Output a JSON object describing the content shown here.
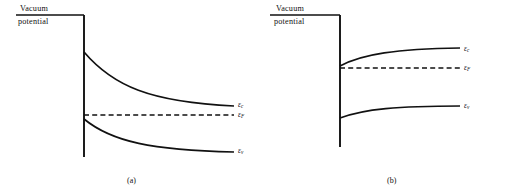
{
  "figure": {
    "width": 515,
    "height": 193,
    "background": "#ffffff",
    "line_color": "#111111"
  },
  "panels": [
    {
      "id": "a",
      "caption": "(a)",
      "caption_x": 127,
      "caption_y": 176,
      "vacuum": {
        "label_top": "Vacuum",
        "label_bottom": "potential",
        "label_top_x": 20,
        "label_top_y": 4,
        "label_bottom_x": 18,
        "label_bottom_y": 17,
        "line_x1": 16,
        "line_x2": 84,
        "line_y": 15
      },
      "wall": {
        "x": 84,
        "y_top": 15,
        "y_bottom": 157
      },
      "bands": [
        {
          "name": "conduction-band",
          "label": "ε",
          "label_sub": "c",
          "label_x": 238,
          "label_y": 100,
          "style": "solid",
          "start_x": 84,
          "start_y": 52,
          "end_x": 234,
          "end_y": 106,
          "bend": "downward",
          "path": "M 84 52 C 113 86, 150 102, 234 106"
        },
        {
          "name": "fermi-level",
          "label": "ε",
          "label_sub": "F",
          "label_x": 238,
          "label_y": 110,
          "style": "dashed",
          "start_x": 84,
          "start_y": 115,
          "end_x": 234,
          "end_y": 115,
          "bend": "flat",
          "path": "M 84 115 L 234 115"
        },
        {
          "name": "valence-band",
          "label": "ε",
          "label_sub": "v",
          "label_x": 238,
          "label_y": 146,
          "style": "solid",
          "start_x": 84,
          "start_y": 119,
          "end_x": 234,
          "end_y": 152,
          "bend": "downward",
          "path": "M 84 119 C 112 142, 152 150, 234 152"
        }
      ]
    },
    {
      "id": "b",
      "caption": "(b)",
      "caption_x": 129,
      "caption_y": 176,
      "vacuum": {
        "label_top": "Vacuum",
        "label_bottom": "potential",
        "label_top_x": 18,
        "label_top_y": 4,
        "label_bottom_x": 16,
        "label_bottom_y": 17,
        "line_x1": 12,
        "line_x2": 82,
        "line_y": 15
      },
      "wall": {
        "x": 82,
        "y_top": 15,
        "y_bottom": 147
      },
      "bands": [
        {
          "name": "conduction-band",
          "label": "ε",
          "label_sub": "c",
          "label_x": 206,
          "label_y": 44,
          "style": "solid",
          "start_x": 82,
          "start_y": 66,
          "end_x": 202,
          "end_y": 48,
          "bend": "upward",
          "path": "M 82 66 C 104 54, 138 49, 202 48"
        },
        {
          "name": "fermi-level",
          "label": "ε",
          "label_sub": "F",
          "label_x": 206,
          "label_y": 63,
          "style": "dashed",
          "start_x": 82,
          "start_y": 68,
          "end_x": 202,
          "end_y": 68,
          "bend": "flat",
          "path": "M 82 68 L 202 68"
        },
        {
          "name": "valence-band",
          "label": "ε",
          "label_sub": "v",
          "label_x": 206,
          "label_y": 101,
          "style": "solid",
          "start_x": 82,
          "start_y": 118,
          "end_x": 202,
          "end_y": 106,
          "bend": "upward",
          "path": "M 82 118 C 106 109, 140 106, 202 106"
        }
      ]
    }
  ]
}
